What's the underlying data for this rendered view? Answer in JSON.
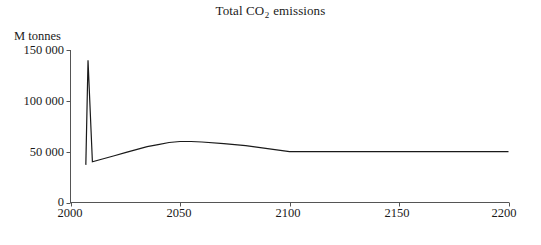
{
  "chart_data": {
    "type": "line",
    "title": "Total CO2 emissions",
    "title_prefix": "Total CO",
    "title_subscript": "2",
    "title_suffix": " emissions",
    "xlabel": "Year",
    "ylabel": "M tonnes",
    "xlim": [
      2000,
      2200
    ],
    "ylim": [
      0,
      150000
    ],
    "grid": false,
    "legend": null,
    "xticks": [
      2000,
      2050,
      2100,
      2150,
      2200
    ],
    "xtick_labels": [
      "2000",
      "2050",
      "2100",
      "2150",
      "2200"
    ],
    "yticks": [
      0,
      50000,
      100000,
      150000
    ],
    "ytick_labels": [
      "0",
      "50 000",
      "100 000",
      "150 000"
    ],
    "series": [
      {
        "name": "Total CO2 emissions",
        "color": "#1a1a1a",
        "x": [
          2007,
          2008,
          2010,
          2015,
          2020,
          2025,
          2030,
          2035,
          2040,
          2045,
          2050,
          2055,
          2060,
          2070,
          2080,
          2090,
          2100,
          2110,
          2120,
          2140,
          2160,
          2180,
          2200
        ],
        "values": [
          37000,
          140000,
          40000,
          43000,
          46000,
          49000,
          52000,
          55000,
          57000,
          59000,
          60000,
          60000,
          59500,
          58000,
          56000,
          53000,
          50000,
          50000,
          50000,
          50000,
          50000,
          50000,
          50000
        ]
      }
    ]
  },
  "axes": {
    "axis_color": "#555555",
    "line_color": "#1a1a1a",
    "background": "#ffffff"
  }
}
